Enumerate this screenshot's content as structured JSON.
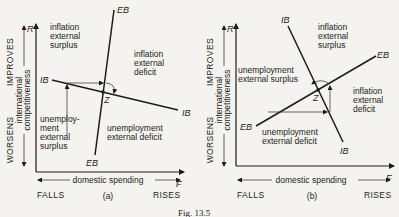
{
  "figure": {
    "caption": "Fig. 13.5",
    "panels": [
      {
        "id": "a",
        "label": "(a)",
        "y_axis_var": "R",
        "x_axis_var": "F",
        "curves": {
          "ib_left": "IB",
          "ib_right": "IB",
          "eb_top": "EB",
          "eb_bottom": "EB"
        },
        "equilibrium": "Z",
        "regions": {
          "top_left": [
            "inflation",
            "external",
            "surplus"
          ],
          "top_right": [
            "inflation",
            "external",
            "deficit"
          ],
          "bottom_left": [
            "unemploy-",
            "ment",
            "external",
            "surplus"
          ],
          "bottom_right": [
            "unemployment",
            "external deficit"
          ]
        }
      },
      {
        "id": "b",
        "label": "(b)",
        "y_axis_var": "R",
        "x_axis_var": "F",
        "curves": {
          "ib_top": "IB",
          "ib_bottom": "IB",
          "eb_right": "EB",
          "eb_left": "EB"
        },
        "equilibrium": "Z",
        "regions": {
          "top": [
            "inflation",
            "external",
            "surplus"
          ],
          "left": [
            "unemployment",
            "external surplus"
          ],
          "right": [
            "inflation",
            "external",
            "deficit"
          ],
          "bottom": [
            "unemployment",
            "external deficit"
          ]
        }
      }
    ],
    "y_axis": {
      "top": "IMPROVES",
      "bottom": "WORSENS",
      "title_1": "international",
      "title_2": "competitiveness"
    },
    "x_axis": {
      "left": "FALLS",
      "right": "RISES",
      "title": "domestic spending"
    }
  }
}
